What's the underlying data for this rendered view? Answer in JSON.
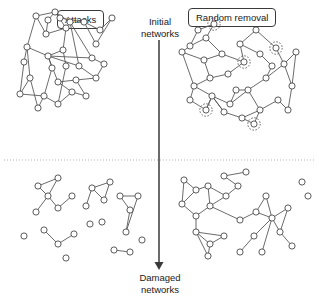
{
  "figure": {
    "title_left": "Attacks",
    "title_right": "Random removal",
    "stage_top": "Initial\nnetworks",
    "stage_bottom": "Damaged\nnetworks",
    "node_color": "#ffffff",
    "node_stroke": "#4a4a4a",
    "edge_color": "#5a5a5a",
    "marker_color": "#555555",
    "divider_color": "#9a9a9a",
    "arrow_color": "#3a3a3a"
  },
  "chart_data": {
    "type": "diagram",
    "columns": [
      "Attacks",
      "Random removal"
    ],
    "rows": [
      "Initial networks",
      "Damaged networks"
    ],
    "panels": [
      {
        "id": "top-left",
        "column": "Attacks",
        "row": "Initial networks",
        "node_count": 30,
        "edge_count": 42,
        "marked_nodes": 0,
        "nodes": [
          [
            36,
            16
          ],
          [
            55,
            12
          ],
          [
            66,
            28
          ],
          [
            46,
            34
          ],
          [
            27,
            47
          ],
          [
            48,
            56
          ],
          [
            63,
            50
          ],
          [
            79,
            66
          ],
          [
            96,
            78
          ],
          [
            76,
            80
          ],
          [
            58,
            82
          ],
          [
            92,
            58
          ],
          [
            70,
            22
          ],
          [
            60,
            18
          ],
          [
            84,
            22
          ],
          [
            100,
            30
          ],
          [
            112,
            18
          ],
          [
            96,
            44
          ],
          [
            30,
            78
          ],
          [
            20,
            94
          ],
          [
            44,
            96
          ],
          [
            58,
            104
          ],
          [
            72,
            92
          ],
          [
            38,
            108
          ],
          [
            52,
            68
          ],
          [
            66,
            66
          ],
          [
            86,
            96
          ],
          [
            104,
            64
          ],
          [
            24,
            62
          ],
          [
            48,
            20
          ]
        ],
        "hub_nodes": [
          [
            48,
            56
          ],
          [
            58,
            82
          ]
        ],
        "edges": [
          [
            0,
            1
          ],
          [
            1,
            2
          ],
          [
            2,
            3
          ],
          [
            3,
            0
          ],
          [
            0,
            4
          ],
          [
            4,
            5
          ],
          [
            5,
            6
          ],
          [
            6,
            2
          ],
          [
            13,
            14
          ],
          [
            14,
            15
          ],
          [
            15,
            16
          ],
          [
            16,
            17
          ],
          [
            17,
            14
          ],
          [
            5,
            7
          ],
          [
            7,
            8
          ],
          [
            8,
            9
          ],
          [
            9,
            10
          ],
          [
            10,
            5
          ],
          [
            4,
            18
          ],
          [
            18,
            19
          ],
          [
            19,
            20
          ],
          [
            20,
            21
          ],
          [
            21,
            22
          ],
          [
            22,
            10
          ],
          [
            18,
            23
          ],
          [
            23,
            20
          ],
          [
            24,
            5
          ],
          [
            25,
            6
          ],
          [
            26,
            22
          ],
          [
            27,
            11
          ],
          [
            28,
            4
          ],
          [
            29,
            1
          ],
          [
            5,
            11
          ],
          [
            11,
            12
          ],
          [
            12,
            1
          ],
          [
            9,
            26
          ],
          [
            20,
            24
          ],
          [
            21,
            25
          ],
          [
            8,
            27
          ],
          [
            19,
            28
          ],
          [
            3,
            29
          ],
          [
            7,
            12
          ]
        ]
      },
      {
        "id": "top-right",
        "column": "Random removal",
        "row": "Initial networks",
        "node_count": 32,
        "edge_count": 45,
        "marked_nodes": 5,
        "marked_indices": [
          2,
          9,
          18,
          24,
          29
        ],
        "nodes": [
          [
            190,
            46
          ],
          [
            206,
            38
          ],
          [
            214,
            24
          ],
          [
            198,
            30
          ],
          [
            182,
            52
          ],
          [
            204,
            60
          ],
          [
            222,
            54
          ],
          [
            240,
            44
          ],
          [
            256,
            30
          ],
          [
            244,
            62
          ],
          [
            228,
            74
          ],
          [
            210,
            78
          ],
          [
            194,
            86
          ],
          [
            212,
            96
          ],
          [
            230,
            104
          ],
          [
            248,
            90
          ],
          [
            266,
            78
          ],
          [
            284,
            64
          ],
          [
            276,
            48
          ],
          [
            292,
            86
          ],
          [
            278,
            100
          ],
          [
            260,
            110
          ],
          [
            242,
            118
          ],
          [
            224,
            112
          ],
          [
            206,
            110
          ],
          [
            190,
            100
          ],
          [
            260,
            54
          ],
          [
            272,
            66
          ],
          [
            296,
            52
          ],
          [
            254,
            124
          ],
          [
            288,
            110
          ],
          [
            236,
            90
          ]
        ],
        "hub_nodes": [
          [
            212,
            96
          ],
          [
            248,
            90
          ]
        ],
        "edges": [
          [
            0,
            1
          ],
          [
            1,
            2
          ],
          [
            2,
            3
          ],
          [
            3,
            0
          ],
          [
            0,
            4
          ],
          [
            4,
            5
          ],
          [
            5,
            6
          ],
          [
            6,
            1
          ],
          [
            7,
            8
          ],
          [
            8,
            18
          ],
          [
            18,
            17
          ],
          [
            17,
            19
          ],
          [
            19,
            28
          ],
          [
            28,
            17
          ],
          [
            5,
            11
          ],
          [
            11,
            12
          ],
          [
            12,
            13
          ],
          [
            13,
            14
          ],
          [
            14,
            15
          ],
          [
            15,
            16
          ],
          [
            16,
            17
          ],
          [
            13,
            24
          ],
          [
            24,
            25
          ],
          [
            25,
            12
          ],
          [
            13,
            23
          ],
          [
            23,
            22
          ],
          [
            22,
            21
          ],
          [
            21,
            15
          ],
          [
            20,
            21
          ],
          [
            20,
            30
          ],
          [
            30,
            19
          ],
          [
            26,
            27
          ],
          [
            27,
            16
          ],
          [
            9,
            10
          ],
          [
            10,
            11
          ],
          [
            7,
            26
          ],
          [
            22,
            29
          ],
          [
            29,
            21
          ],
          [
            31,
            14
          ],
          [
            31,
            15
          ],
          [
            6,
            9
          ],
          [
            9,
            7
          ],
          [
            4,
            12
          ],
          [
            23,
            13
          ],
          [
            24,
            13
          ]
        ]
      },
      {
        "id": "bottom-left",
        "column": "Attacks",
        "row": "Damaged networks",
        "node_count": 24,
        "edge_count": 17,
        "marked_nodes": 0,
        "fragmented": true,
        "isolated_nodes": 6,
        "nodes": [
          [
            38,
            186
          ],
          [
            58,
            178
          ],
          [
            48,
            196
          ],
          [
            36,
            212
          ],
          [
            58,
            208
          ],
          [
            72,
            196
          ],
          [
            92,
            188
          ],
          [
            110,
            182
          ],
          [
            104,
            200
          ],
          [
            86,
            206
          ],
          [
            44,
            230
          ],
          [
            58,
            244
          ],
          [
            74,
            234
          ],
          [
            90,
            224
          ],
          [
            66,
            258
          ],
          [
            102,
            222
          ],
          [
            120,
            196
          ],
          [
            130,
            210
          ],
          [
            126,
            232
          ],
          [
            138,
            196
          ],
          [
            114,
            250
          ],
          [
            130,
            252
          ],
          [
            142,
            240
          ],
          [
            24,
            236
          ]
        ],
        "edges": [
          [
            0,
            1
          ],
          [
            1,
            2
          ],
          [
            2,
            0
          ],
          [
            2,
            3
          ],
          [
            2,
            4
          ],
          [
            4,
            5
          ],
          [
            6,
            7
          ],
          [
            7,
            8
          ],
          [
            8,
            6
          ],
          [
            9,
            6
          ],
          [
            10,
            11
          ],
          [
            11,
            12
          ],
          [
            16,
            17
          ],
          [
            17,
            18
          ],
          [
            18,
            19
          ],
          [
            19,
            16
          ],
          [
            20,
            21
          ]
        ]
      },
      {
        "id": "bottom-right",
        "column": "Random removal",
        "row": "Damaged networks",
        "node_count": 26,
        "edge_count": 30,
        "marked_nodes": 0,
        "fragmented": false,
        "isolated_nodes": 2,
        "nodes": [
          [
            184,
            180
          ],
          [
            196,
            190
          ],
          [
            182,
            204
          ],
          [
            196,
            216
          ],
          [
            210,
            206
          ],
          [
            208,
            186
          ],
          [
            224,
            176
          ],
          [
            238,
            186
          ],
          [
            246,
            172
          ],
          [
            226,
            196
          ],
          [
            196,
            232
          ],
          [
            210,
            244
          ],
          [
            224,
            236
          ],
          [
            208,
            256
          ],
          [
            240,
            220
          ],
          [
            256,
            212
          ],
          [
            272,
            218
          ],
          [
            266,
            196
          ],
          [
            288,
            208
          ],
          [
            280,
            232
          ],
          [
            292,
            246
          ],
          [
            254,
            236
          ],
          [
            240,
            252
          ],
          [
            302,
            182
          ],
          [
            308,
            196
          ],
          [
            262,
            252
          ]
        ],
        "hub_nodes": [
          [
            272,
            218
          ]
        ],
        "edges": [
          [
            0,
            1
          ],
          [
            1,
            2
          ],
          [
            2,
            3
          ],
          [
            3,
            4
          ],
          [
            4,
            5
          ],
          [
            5,
            1
          ],
          [
            6,
            7
          ],
          [
            7,
            9
          ],
          [
            9,
            5
          ],
          [
            6,
            8
          ],
          [
            3,
            10
          ],
          [
            10,
            11
          ],
          [
            11,
            12
          ],
          [
            12,
            10
          ],
          [
            11,
            13
          ],
          [
            4,
            14
          ],
          [
            14,
            15
          ],
          [
            15,
            16
          ],
          [
            16,
            17
          ],
          [
            17,
            15
          ],
          [
            16,
            18
          ],
          [
            18,
            19
          ],
          [
            19,
            20
          ],
          [
            16,
            21
          ],
          [
            21,
            22
          ],
          [
            16,
            25
          ],
          [
            2,
            0
          ],
          [
            9,
            4
          ],
          [
            13,
            10
          ],
          [
            19,
            16
          ]
        ]
      }
    ],
    "annotations": {
      "dashed_circles": "Randomly selected nodes in the top-right panel are highlighted with dashed circles",
      "arrow": "Downward arrow from Initial networks to Damaged networks",
      "divider": "Dotted horizontal line separating initial and damaged rows"
    }
  }
}
